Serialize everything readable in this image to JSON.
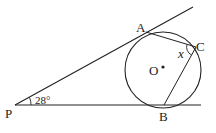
{
  "diagram": {
    "type": "geometry",
    "points": {
      "P": {
        "label": "P"
      },
      "A": {
        "label": "A"
      },
      "B": {
        "label": "B"
      },
      "C": {
        "label": "C"
      },
      "O": {
        "label": "O"
      }
    },
    "angle_P": {
      "label": "28°"
    },
    "angle_C": {
      "label": "x"
    },
    "colors": {
      "stroke": "#222222",
      "background": "#ffffff"
    }
  }
}
